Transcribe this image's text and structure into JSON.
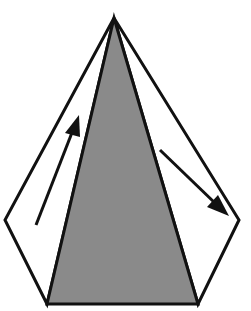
{
  "diagram": {
    "type": "geometric-figure",
    "colors": {
      "background": "#ffffff",
      "stroke": "#111111",
      "shaded_face": "#8a8a8a",
      "white_face": "#ffffff",
      "arrow": "#111111"
    },
    "vertices": {
      "apex": [
        114,
        18
      ],
      "left_outer": [
        5,
        220
      ],
      "right_outer": [
        239,
        220
      ],
      "bottom_left": [
        47,
        304
      ],
      "bottom_right": [
        198,
        304
      ]
    },
    "faces": [
      {
        "name": "left-face",
        "fill": "white"
      },
      {
        "name": "center-face",
        "fill": "gray"
      },
      {
        "name": "right-face",
        "fill": "white"
      }
    ],
    "arrows": [
      {
        "name": "left-arrow",
        "direction": "up-right",
        "from": [
          36,
          225
        ],
        "to": [
          78,
          116
        ]
      },
      {
        "name": "right-arrow",
        "direction": "down-right",
        "from": [
          160,
          150
        ],
        "to": [
          228,
          215
        ]
      }
    ]
  }
}
